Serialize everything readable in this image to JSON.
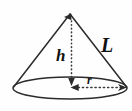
{
  "figure": {
    "kind": "geometry-diagram",
    "shape_name": "cone",
    "title": "",
    "background_color": "#fefefe",
    "stroke_color": "#2b2b2b",
    "label_color": "#111111",
    "labels": {
      "height": "h",
      "slant_height": "L",
      "radius": "r"
    },
    "annotations": {
      "height_line_style": "dotted",
      "radius_line_style": "dotted",
      "slant_line_style": "solid",
      "base_line_style": "solid",
      "height_arrow_ends": "both",
      "radius_arrow_ends": "both"
    },
    "geometry": {
      "apex_x": 70,
      "apex_y": 13,
      "base_center_x": 70,
      "base_center_y": 88,
      "base_radius_x": 57,
      "base_radius_y": 11,
      "canvas_width": 132,
      "canvas_height": 111
    }
  }
}
